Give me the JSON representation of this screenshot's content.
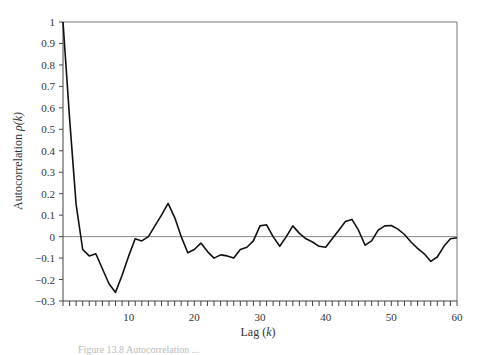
{
  "chart_data": {
    "type": "line",
    "title": "",
    "xlabel": "Lag (k)",
    "xlabel_main": "Lag (",
    "xlabel_var": "k",
    "xlabel_close": ")",
    "ylabel": "Autocorrelation ρ(k)",
    "ylabel_main": "Autocorrelation ",
    "ylabel_var": "ρ(k)",
    "xlim": [
      0,
      60
    ],
    "ylim": [
      -0.3,
      1
    ],
    "x_ticks": [
      10,
      20,
      30,
      40,
      50,
      60
    ],
    "x_minor_tick_step": 1,
    "y_ticks": [
      -0.3,
      -0.2,
      -0.1,
      0,
      0.1,
      0.2,
      0.3,
      0.4,
      0.5,
      0.6,
      0.7,
      0.8,
      0.9,
      1
    ],
    "y_tick_labels": [
      "−0.3",
      "−0.2",
      "−0.1",
      "0",
      "0.1",
      "0.2",
      "0.3",
      "0.4",
      "0.5",
      "0.6",
      "0.7",
      "0.8",
      "0.9",
      "1"
    ],
    "grid": false,
    "zero_line": true,
    "legend": null,
    "series": [
      {
        "name": "autocorrelation",
        "x": [
          0,
          1,
          2,
          3,
          4,
          5,
          6,
          7,
          8,
          9,
          10,
          11,
          12,
          13,
          14,
          15,
          16,
          17,
          18,
          19,
          20,
          21,
          22,
          23,
          24,
          25,
          26,
          27,
          28,
          29,
          30,
          31,
          32,
          33,
          34,
          35,
          36,
          37,
          38,
          39,
          40,
          41,
          42,
          43,
          44,
          45,
          46,
          47,
          48,
          49,
          50,
          51,
          52,
          53,
          54,
          55,
          56,
          57,
          58,
          59,
          60
        ],
        "values": [
          1.0,
          0.55,
          0.15,
          -0.06,
          -0.09,
          -0.08,
          -0.15,
          -0.22,
          -0.26,
          -0.18,
          -0.09,
          -0.01,
          -0.02,
          0.0,
          0.05,
          0.1,
          0.155,
          0.09,
          0.0,
          -0.075,
          -0.06,
          -0.03,
          -0.07,
          -0.1,
          -0.085,
          -0.09,
          -0.1,
          -0.06,
          -0.05,
          -0.02,
          0.05,
          0.055,
          0.0,
          -0.045,
          0.0,
          0.05,
          0.015,
          -0.01,
          -0.025,
          -0.045,
          -0.05,
          -0.01,
          0.03,
          0.07,
          0.08,
          0.03,
          -0.04,
          -0.02,
          0.03,
          0.05,
          0.052,
          0.035,
          0.01,
          -0.025,
          -0.055,
          -0.08,
          -0.115,
          -0.095,
          -0.045,
          -0.01,
          -0.005
        ]
      }
    ]
  },
  "caption": "Figure 13.8   Autocorrelation ..."
}
